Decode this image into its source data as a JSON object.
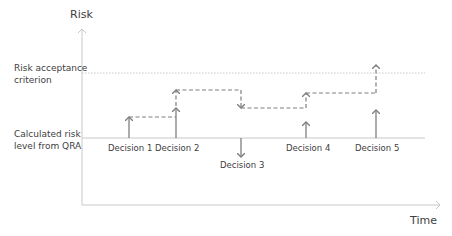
{
  "axes": {
    "y_label": "Risk",
    "x_label": "Time"
  },
  "levels": {
    "acceptance_line1": "Risk acceptance",
    "acceptance_line2": "criterion",
    "calculated_line1": "Calculated risk",
    "calculated_line2": "level from QRA"
  },
  "decisions": [
    {
      "label": "Decision 1",
      "direction": "up"
    },
    {
      "label": "Decision 2",
      "direction": "up"
    },
    {
      "label": "Decision 3",
      "direction": "down"
    },
    {
      "label": "Decision 4",
      "direction": "up"
    },
    {
      "label": "Decision 5",
      "direction": "up"
    }
  ],
  "colors": {
    "axis": "#c8c8c8",
    "arrow": "#7f7f7f",
    "text": "#404040"
  }
}
